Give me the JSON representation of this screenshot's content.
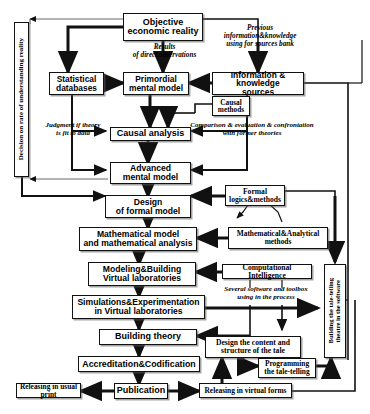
{
  "diagram": {
    "line_color": "#111111",
    "box_fill": "#ffffff",
    "background": "#ffffff"
  },
  "nodes": {
    "objective_economic_reality": "Objective\neconomic reality",
    "statistical_databases": "Statistical\ndatabases",
    "primordial_mental_model": "Primordial\nmental model",
    "information_knowledge_sources": "Information & knowledge\nsources",
    "causal_methods": "Causal\nmethods",
    "causal_analysis": "Causal analysis",
    "advanced_mental_model": "Advanced\nmental model",
    "design_of_formal_model": "Design\nof formal model",
    "formal_logics_methods": "Formal\nlogics&methods",
    "mathematical_model": "Mathematical model\nand mathematical analysis",
    "mathematical_analytical_methods": "Mathematical&Analytical\nmethods",
    "modeling_building_virtual_laboratories": "Modeling&Building\nVirtual laboratories",
    "computational_intelligence": "Computational Intelligence",
    "simulations_experimentation": "Simulations&Experimentation\nin Virtual laboratories",
    "building_theory": "Building theory",
    "design_content_structure_tale": "Design the content and\nstructure of the tale",
    "programming_tale_telling": "Programming\nthe tale-telling",
    "accreditation_codification": "Accreditation&Codification",
    "publication": "Publication",
    "releasing_usual_print": "Releasing in usual print",
    "releasing_virtual_forms": "Releasing in virtual forms",
    "decision_on_rate": "Decision on rate of understanding reality",
    "building_tale_telling_theatre_line1": "Building the tale-telling",
    "building_tale_telling_theatre_line2": "theatre in the software"
  },
  "annotations": {
    "results_of_direct_observations": "Results\nof  direct observations",
    "previous_information": "Previous\ninformation&knowledge\nusing for sources bank",
    "judgment_if_theory": "Judgment if theory\nis fit to data",
    "comparison_evaluation": "Comparison & evaluation & confrontation\nwith former theories",
    "several_software": "Several software and toolbox\nusing in the process"
  }
}
